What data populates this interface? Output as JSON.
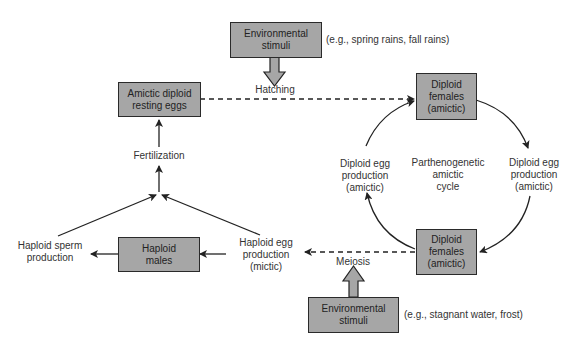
{
  "diagram": {
    "boxes": {
      "env_top": "Environmental\nstimuli",
      "resting_eggs": "Amictic diploid\nresting eggs",
      "females_top": "Diploid\nfemales\n(amictic)",
      "females_bottom": "Diploid\nfemales\n(amictic)",
      "males": "Haploid\nmales",
      "env_bottom": "Environmental\nstimuli"
    },
    "labels": {
      "env_top_examples": "(e.g., spring rains, fall rains)",
      "hatching": "Hatching",
      "fertilization": "Fertilization",
      "diploid_egg_left": "Diploid egg\nproduction\n(amictic)",
      "diploid_egg_right": "Diploid egg\nproduction\n(amictic)",
      "cycle_center": "Parthenogenetic\namictic\ncycle",
      "haploid_sperm": "Haploid sperm\nproduction",
      "haploid_egg": "Haploid egg\nproduction\n(mictic)",
      "meiosis": "Meiosis",
      "env_bottom_examples": "(e.g., stagnant water, frost)"
    },
    "colors": {
      "box_fill": "#a6a6a6",
      "stroke": "#222222"
    }
  }
}
